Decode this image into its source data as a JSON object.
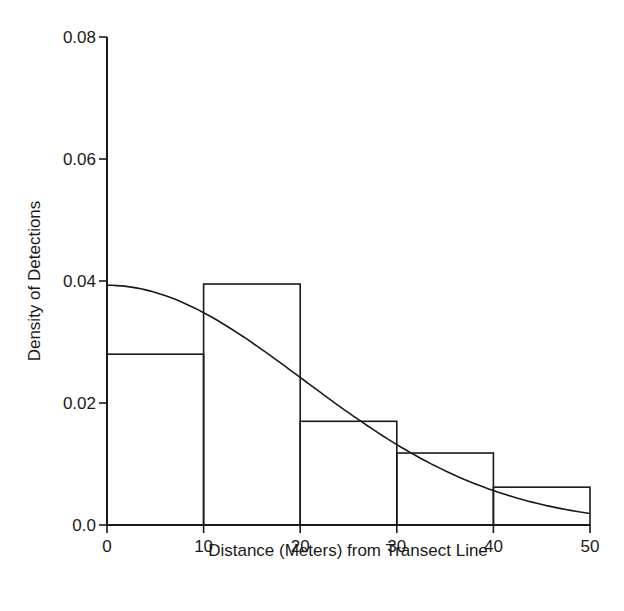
{
  "chart_data": {
    "type": "bar",
    "title": "",
    "xlabel": "Distance (Meters) from Transect Line",
    "ylabel": "Density of Detections",
    "xlim": [
      0,
      50
    ],
    "ylim": [
      0,
      0.08
    ],
    "grid": false,
    "legend": null,
    "x_ticks": [
      0,
      10,
      20,
      30,
      40,
      50
    ],
    "x_tick_labels": [
      "0",
      "10",
      "20",
      "30",
      "40",
      "50"
    ],
    "y_ticks": [
      0,
      0.02,
      0.04,
      0.06,
      0.08
    ],
    "y_tick_labels": [
      "0.0",
      "0.02",
      "0.04",
      "0.06",
      "0.08"
    ],
    "bins": [
      [
        0,
        10
      ],
      [
        10,
        20
      ],
      [
        20,
        30
      ],
      [
        30,
        40
      ],
      [
        40,
        50
      ]
    ],
    "categories": [
      "0-10",
      "10-20",
      "20-30",
      "30-40",
      "40-50"
    ],
    "values": [
      0.028,
      0.0395,
      0.017,
      0.0118,
      0.0062
    ],
    "fitted_curve": {
      "type": "line",
      "description": "half-normal detection density",
      "x": [
        0,
        5,
        10,
        15,
        20,
        25,
        30,
        35,
        40,
        45,
        50
      ],
      "y": [
        0.0393,
        0.0381,
        0.0348,
        0.0299,
        0.0242,
        0.0184,
        0.0132,
        0.0089,
        0.0056,
        0.0034,
        0.0019
      ]
    }
  }
}
